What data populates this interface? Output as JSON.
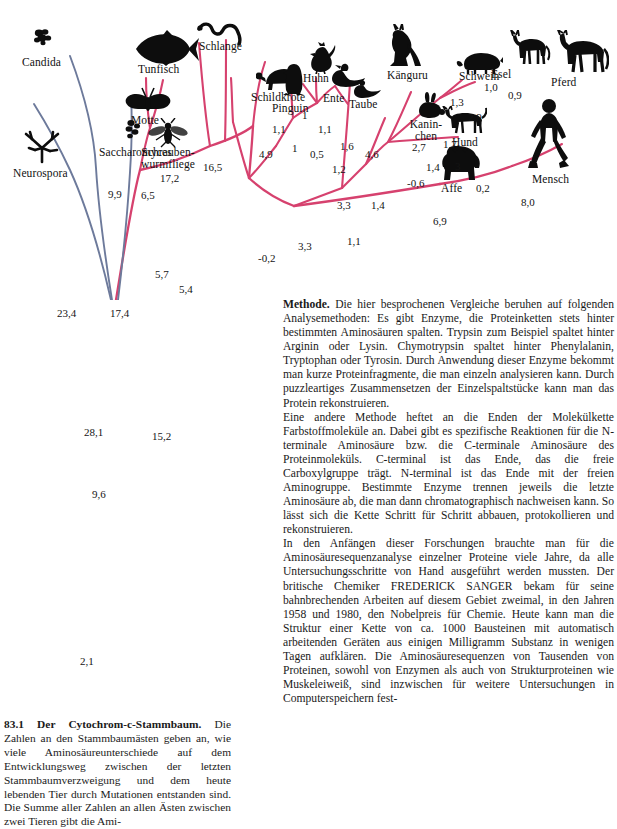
{
  "figure": {
    "title_number": "83.1",
    "colors": {
      "tree_animal": "#d6416e",
      "tree_fungus": "#6d7a9b",
      "silhouette": "#0d0d0d",
      "text": "#141414",
      "background": "#ffffff"
    },
    "taxa": [
      {
        "id": "candida",
        "label": "Candida",
        "icon": "yeast-cluster-icon"
      },
      {
        "id": "neurospora",
        "label": "Neurospora",
        "icon": "mold-hyphae-icon"
      },
      {
        "id": "saccharomyces",
        "label": "Saccharomyces",
        "icon": "yeast-cluster-icon"
      },
      {
        "id": "tunfisch",
        "label": "Tunfisch",
        "icon": "tuna-fish-icon"
      },
      {
        "id": "schlange",
        "label": "Schlange",
        "icon": "snake-icon"
      },
      {
        "id": "motte",
        "label": "Motte",
        "icon": "moth-icon"
      },
      {
        "id": "schraubenwurmfliege",
        "label": "Schrauben-\nwurmfliege",
        "icon": "screwworm-fly-icon"
      },
      {
        "id": "schildkroete",
        "label": "Schildkröte",
        "icon": "turtle-icon"
      },
      {
        "id": "pinguin",
        "label": "Pinguin",
        "icon": "penguin-icon"
      },
      {
        "id": "huhn",
        "label": "Huhn",
        "icon": "chicken-icon"
      },
      {
        "id": "ente",
        "label": "Ente",
        "icon": "duck-icon"
      },
      {
        "id": "taube",
        "label": "Taube",
        "icon": "pigeon-icon"
      },
      {
        "id": "kaenguru",
        "label": "Känguru",
        "icon": "kangaroo-icon"
      },
      {
        "id": "kaninchen",
        "label": "Kanin-\nchen",
        "icon": "rabbit-icon"
      },
      {
        "id": "schwein",
        "label": "Schwein",
        "icon": "pig-icon"
      },
      {
        "id": "esel",
        "label": "Esel",
        "icon": "donkey-icon"
      },
      {
        "id": "pferd",
        "label": "Pferd",
        "icon": "horse-icon"
      },
      {
        "id": "hund",
        "label": "Hund",
        "icon": "dog-icon"
      },
      {
        "id": "affe",
        "label": "Affe",
        "icon": "gorilla-icon"
      },
      {
        "id": "mensch",
        "label": "Mensch",
        "icon": "human-walking-icon"
      }
    ],
    "branch_values": [
      {
        "id": "n-9-9",
        "value": "9,9"
      },
      {
        "id": "n-6-5",
        "value": "6,5"
      },
      {
        "id": "n-17-2",
        "value": "17,2"
      },
      {
        "id": "n-16-5",
        "value": "16,5"
      },
      {
        "id": "n-23-4",
        "value": "23,4"
      },
      {
        "id": "n-17-4",
        "value": "17,4"
      },
      {
        "id": "n-5-7",
        "value": "5,7"
      },
      {
        "id": "n-5-4",
        "value": "5,4"
      },
      {
        "id": "n-28-1",
        "value": "28,1"
      },
      {
        "id": "n-9-6",
        "value": "9,6"
      },
      {
        "id": "n-15-2",
        "value": "15,2"
      },
      {
        "id": "n-2-1",
        "value": "2,1"
      },
      {
        "id": "n-4-9",
        "value": "4,9"
      },
      {
        "id": "n-1-1a",
        "value": "1,1"
      },
      {
        "id": "n-1a",
        "value": "1"
      },
      {
        "id": "n-1b",
        "value": "1"
      },
      {
        "id": "n-1-1b",
        "value": "1,1"
      },
      {
        "id": "n-0-5",
        "value": "0,5"
      },
      {
        "id": "n-1-6",
        "value": "1,6"
      },
      {
        "id": "n-1-2",
        "value": "1,2"
      },
      {
        "id": "n-4-6",
        "value": "4,6"
      },
      {
        "id": "n-3-3a",
        "value": "3,3"
      },
      {
        "id": "n-3-3b",
        "value": "3,3"
      },
      {
        "id": "n-minus02",
        "value": "-0,2"
      },
      {
        "id": "n-1-1c",
        "value": "1,1"
      },
      {
        "id": "n-1-4a",
        "value": "1,4"
      },
      {
        "id": "n-minus06",
        "value": "-0,6"
      },
      {
        "id": "n-2-7",
        "value": "2,7"
      },
      {
        "id": "n-1-4b",
        "value": "1,4"
      },
      {
        "id": "n-1-3",
        "value": "1,3"
      },
      {
        "id": "n-1-7",
        "value": "1,7"
      },
      {
        "id": "n-2-9",
        "value": "2,9"
      },
      {
        "id": "n-1-0",
        "value": "1,0"
      },
      {
        "id": "n-0-9",
        "value": "0,9"
      },
      {
        "id": "n-3",
        "value": "3"
      },
      {
        "id": "n-6-9",
        "value": "6,9"
      },
      {
        "id": "n-0-2",
        "value": "0,2"
      },
      {
        "id": "n-8-0",
        "value": "8,0"
      }
    ]
  },
  "body_text": {
    "p1_lead": "Methode.",
    "p1": " Die hier besprochenen Vergleiche beruhen auf folgenden Analysemethoden: Es gibt Enzyme, die Proteinketten stets hinter bestimmten Aminosäuren spalten. Trypsin zum Beispiel spaltet hinter Arginin oder Lysin. Chymotrypsin spaltet hinter Phenylalanin, Tryptophan oder Tyrosin. Durch Anwendung dieser Enzyme bekommt man kurze Proteinfragmente, die man einzeln analysieren kann. Durch puzzleartiges Zusammensetzen der Einzelspaltstücke kann man das Protein rekonstruieren.",
    "p2": "Eine andere Methode heftet an die Enden der Molekülkette Farbstoffmoleküle an. Dabei gibt es spezifische Reaktionen für die N-terminale Aminosäure bzw. die C-terminale Aminosäure des Proteinmoleküls. C-terminal ist das Ende, das die freie Carboxylgruppe trägt. N-terminal ist das Ende mit der freien Aminogruppe. Bestimmte Enzyme trennen jeweils die letzte Aminosäure ab, die man dann chromatographisch nachweisen kann. So lässt sich die Kette Schritt für Schritt abbauen, protokollieren und rekonstruieren.",
    "p3": "In den Anfängen dieser Forschungen brauchte man für die Aminosäuresequenzanalyse einzelner Proteine viele Jahre, da alle Untersuchungsschritte von Hand ausgeführt werden mussten. Der britische Chemiker FREDERICK SANGER bekam für seine bahnbrechenden Arbeiten auf diesem Gebiet zweimal, in den Jahren 1958 und 1980, den Nobelpreis für Chemie. Heute kann man die Struktur einer Kette von ca. 1000 Bausteinen mit automatisch arbeitenden Geräten aus einigen Milligramm Substanz in wenigen Tagen aufklären. Die Aminosäuresequenzen von Tausenden von Proteinen, sowohl von Enzymen als auch von Strukturproteinen wie Muskeleiweiß, sind inzwischen für weitere Untersuchungen in Computerspeichern fest-"
  },
  "caption": {
    "lead": "83.1 Der Cytochrom-c-Stammbaum.",
    "text": " Die Zahlen an den Stammbaumästen geben an, wie viele Aminosäureunterschiede auf dem Entwicklungsweg zwischen der letzten Stammbaumverzweigung und dem heute lebenden Tier durch Mutationen entstanden sind. Die Summe aller Zahlen an allen Ästen zwischen zwei Tieren gibt die Ami-"
  }
}
